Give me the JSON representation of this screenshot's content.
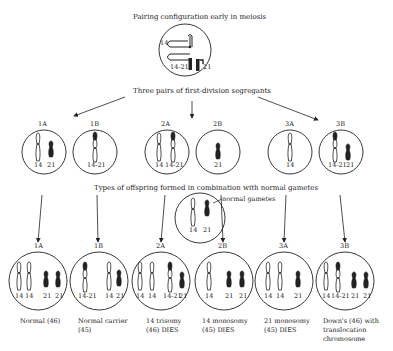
{
  "title": "Pairing configuration early in meiosis",
  "pairing": {
    "labels": [
      "14",
      "14-21",
      "21"
    ]
  },
  "segregants_title": "Three pairs of first-division segregants",
  "segregants": [
    {
      "id": "1A",
      "chromosomes": [
        "14",
        "21"
      ]
    },
    {
      "id": "1B",
      "chromosomes": [
        "14-21"
      ]
    },
    {
      "id": "2A",
      "chromosomes": [
        "14",
        "14-21"
      ]
    },
    {
      "id": "2B",
      "chromosomes": [
        "21"
      ]
    },
    {
      "id": "3A",
      "chromosomes": [
        "14"
      ]
    },
    {
      "id": "3B",
      "chromosomes": [
        "14-21",
        "21"
      ]
    }
  ],
  "offspring_title": "Types of offspring formed in combination with normal gametes",
  "normal_gametes": {
    "label": "normal gametes",
    "chromosomes": [
      "14",
      "21"
    ]
  },
  "offspring": [
    {
      "id": "1A",
      "chromosomes": [
        "14",
        "14",
        "21",
        "21"
      ],
      "caption_lines": [
        "Normal (46)"
      ]
    },
    {
      "id": "1B",
      "chromosomes": [
        "14-21",
        "14",
        "21"
      ],
      "caption_lines": [
        "Normal carrier",
        "(45)"
      ]
    },
    {
      "id": "2A",
      "chromosomes": [
        "14",
        "14",
        "14-21",
        "21"
      ],
      "caption_lines": [
        "14 trisomy",
        "(46) DIES"
      ]
    },
    {
      "id": "2B",
      "chromosomes": [
        "14",
        "21",
        "21"
      ],
      "caption_lines": [
        "14 monosomy",
        "(45) DIES"
      ]
    },
    {
      "id": "3A",
      "chromosomes": [
        "14",
        "14",
        "21"
      ],
      "caption_lines": [
        "21 monosomy",
        "(45) DIES"
      ]
    },
    {
      "id": "3B",
      "chromosomes": [
        "14",
        "14-21",
        "21",
        "21"
      ],
      "caption_lines": [
        "Down's (46) with",
        "translocation",
        "chromosome"
      ]
    }
  ]
}
